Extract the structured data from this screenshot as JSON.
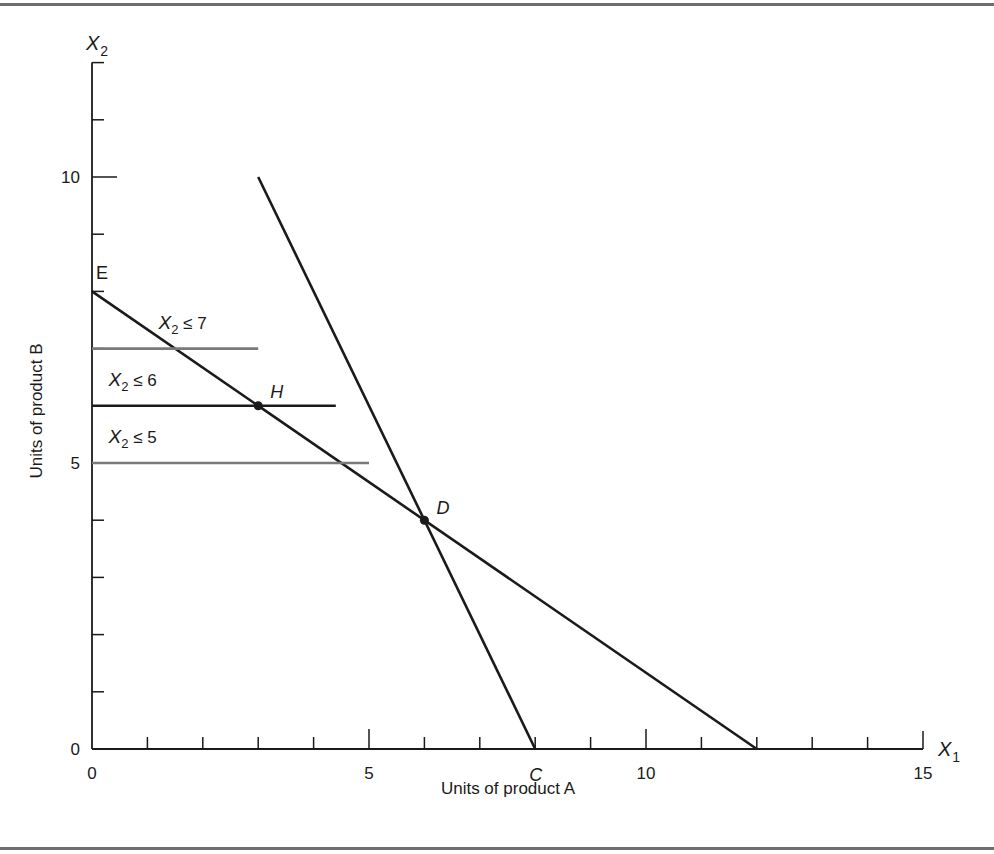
{
  "chart_data": {
    "type": "line",
    "title": "",
    "xlabel": "Units of product A",
    "ylabel": "Units of product B",
    "x_axis_var": {
      "base": "X",
      "sub": "1"
    },
    "y_axis_var": {
      "base": "X",
      "sub": "2"
    },
    "xlim": [
      0,
      15
    ],
    "ylim": [
      0,
      12
    ],
    "x_ticks": [
      0,
      1,
      2,
      3,
      4,
      5,
      6,
      7,
      8,
      9,
      10,
      11,
      12,
      13,
      14,
      15
    ],
    "x_tick_labels": [
      {
        "value": 0,
        "label": "0"
      },
      {
        "value": 5,
        "label": "5"
      },
      {
        "value": 10,
        "label": "10"
      },
      {
        "value": 15,
        "label": "15"
      }
    ],
    "y_ticks": [
      0,
      1,
      2,
      3,
      4,
      5,
      6,
      7,
      8,
      9,
      10,
      11,
      12
    ],
    "y_tick_labels": [
      {
        "value": 0,
        "label": "0"
      },
      {
        "value": 5,
        "label": "5"
      },
      {
        "value": 10,
        "label": "10"
      }
    ],
    "grid": false,
    "series": [
      {
        "name": "Constraint E–12",
        "color": "#1a1a1a",
        "width": 2.6,
        "points": [
          [
            0,
            8
          ],
          [
            12,
            0
          ]
        ]
      },
      {
        "name": "Constraint steep (through C)",
        "color": "#1a1a1a",
        "width": 2.6,
        "points": [
          [
            3,
            10
          ],
          [
            8,
            0
          ]
        ]
      },
      {
        "name": "X2 ≤ 7",
        "color": "#7a7a7a",
        "width": 2.6,
        "points": [
          [
            0,
            7
          ],
          [
            3,
            7
          ]
        ]
      },
      {
        "name": "X2 ≤ 6",
        "color": "#1a1a1a",
        "width": 2.6,
        "points": [
          [
            0,
            6
          ],
          [
            4.4,
            6
          ]
        ]
      },
      {
        "name": "X2 ≤ 5",
        "color": "#7a7a7a",
        "width": 2.6,
        "points": [
          [
            0,
            5
          ],
          [
            5,
            5
          ]
        ]
      }
    ],
    "constraint_labels": [
      {
        "text_base": "X",
        "text_sub": "2",
        "text_rest": " ≤ 7",
        "x": 1.2,
        "y": 7.35
      },
      {
        "text_base": "X",
        "text_sub": "2",
        "text_rest": " ≤ 6",
        "x": 0.3,
        "y": 6.35
      },
      {
        "text_base": "X",
        "text_sub": "2",
        "text_rest": " ≤ 5",
        "x": 0.3,
        "y": 5.35
      }
    ],
    "points": [
      {
        "label": "E",
        "x": 0,
        "y": 8,
        "marker": false,
        "italic": false,
        "dx": 4,
        "dy": -12
      },
      {
        "label": "H",
        "x": 3,
        "y": 6,
        "marker": true,
        "italic": true,
        "dx": 12,
        "dy": -8
      },
      {
        "label": "D",
        "x": 6,
        "y": 4,
        "marker": true,
        "italic": true,
        "dx": 12,
        "dy": -6
      },
      {
        "label": "C",
        "x": 8,
        "y": 0,
        "marker": false,
        "italic": true,
        "dx": -6,
        "dy": 32
      }
    ]
  },
  "layout": {
    "origin_px": [
      92,
      749
    ],
    "px_per_x": 55.4,
    "px_per_y": 57.2
  }
}
